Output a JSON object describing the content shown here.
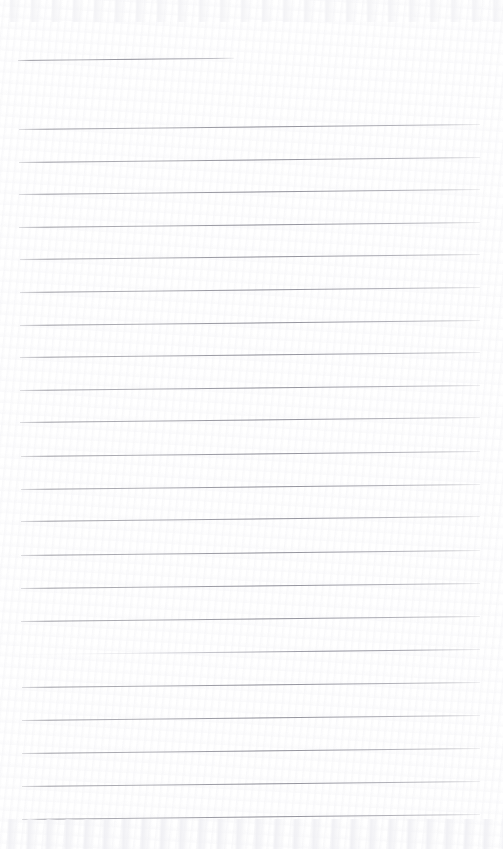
{
  "document": {
    "kind": "scanned-lined-notebook-page",
    "title": "Blank ruled notebook page (scan)",
    "page_width": 503,
    "page_height": 849,
    "background_color": "#ffffff",
    "rule_color": "#8a8a94",
    "has_text_content": false,
    "text_content": "",
    "margin_rule": false,
    "holes": 0,
    "skew_degrees": -0.62
  },
  "ruled_lines": [
    {
      "id": "line-1",
      "x": 18,
      "y": 60,
      "length": 216,
      "partial": true,
      "faded_left": false
    },
    {
      "id": "line-2",
      "x": 19,
      "y": 129,
      "length": 461,
      "partial": false,
      "faded_left": false
    },
    {
      "id": "line-3",
      "x": 19,
      "y": 162,
      "length": 461,
      "partial": false,
      "faded_left": false
    },
    {
      "id": "line-4",
      "x": 19,
      "y": 194,
      "length": 461,
      "partial": false,
      "faded_left": false
    },
    {
      "id": "line-5",
      "x": 19,
      "y": 227,
      "length": 461,
      "partial": false,
      "faded_left": false
    },
    {
      "id": "line-6",
      "x": 20,
      "y": 259,
      "length": 460,
      "partial": false,
      "faded_left": false
    },
    {
      "id": "line-7",
      "x": 20,
      "y": 292,
      "length": 460,
      "partial": false,
      "faded_left": false
    },
    {
      "id": "line-8",
      "x": 20,
      "y": 325,
      "length": 460,
      "partial": false,
      "faded_left": false
    },
    {
      "id": "line-9",
      "x": 20,
      "y": 357,
      "length": 460,
      "partial": false,
      "faded_left": false
    },
    {
      "id": "line-10",
      "x": 20,
      "y": 390,
      "length": 460,
      "partial": false,
      "faded_left": false
    },
    {
      "id": "line-11",
      "x": 20,
      "y": 422,
      "length": 460,
      "partial": false,
      "faded_left": false
    },
    {
      "id": "line-12",
      "x": 21,
      "y": 456,
      "length": 459,
      "partial": false,
      "faded_left": false
    },
    {
      "id": "line-13",
      "x": 21,
      "y": 489,
      "length": 459,
      "partial": false,
      "faded_left": false
    },
    {
      "id": "line-14",
      "x": 21,
      "y": 521,
      "length": 459,
      "partial": false,
      "faded_left": false
    },
    {
      "id": "line-15",
      "x": 21,
      "y": 555,
      "length": 459,
      "partial": false,
      "faded_left": false
    },
    {
      "id": "line-16",
      "x": 21,
      "y": 588,
      "length": 459,
      "partial": false,
      "faded_left": false
    },
    {
      "id": "line-17",
      "x": 21,
      "y": 621,
      "length": 459,
      "partial": false,
      "faded_left": false
    },
    {
      "id": "line-18",
      "x": 22,
      "y": 654,
      "length": 458,
      "partial": false,
      "faded_left": true
    },
    {
      "id": "line-19",
      "x": 22,
      "y": 687,
      "length": 458,
      "partial": false,
      "faded_left": false
    },
    {
      "id": "line-20",
      "x": 22,
      "y": 720,
      "length": 458,
      "partial": false,
      "faded_left": false
    },
    {
      "id": "line-21",
      "x": 22,
      "y": 753,
      "length": 458,
      "partial": false,
      "faded_left": false
    },
    {
      "id": "line-22",
      "x": 22,
      "y": 786,
      "length": 458,
      "partial": false,
      "faded_left": false
    },
    {
      "id": "line-23",
      "x": 22,
      "y": 819,
      "length": 458,
      "partial": false,
      "faded_left": false
    }
  ]
}
